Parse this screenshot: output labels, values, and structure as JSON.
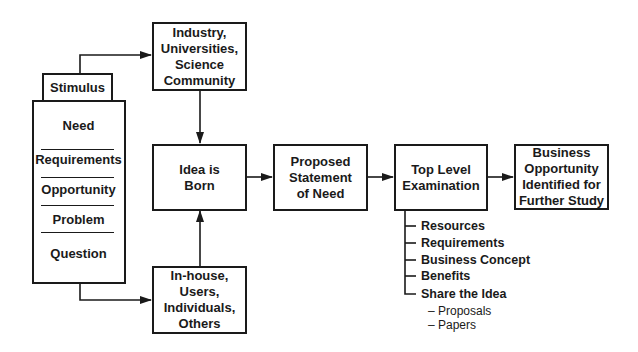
{
  "diagram": {
    "stimulus": {
      "header": "Stimulus",
      "items": [
        "Need",
        "Requirements",
        "Opportunity",
        "Problem",
        "Question"
      ]
    },
    "sources": {
      "external": "Industry,\nUniversities,\nScience\nCommunity",
      "internal": "In-house,\nUsers,\nIndividuals,\nOthers"
    },
    "flow": {
      "idea": "Idea is\nBorn",
      "proposed": "Proposed\nStatement\nof Need",
      "top_level": "Top Level\nExamination",
      "business": "Business\nOpportunity\nIdentified for\nFurther Study"
    },
    "examination_items": [
      "Resources",
      "Requirements",
      "Business Concept",
      "Benefits",
      "Share the Idea"
    ],
    "share_sub_items": [
      "– Proposals",
      "– Papers"
    ],
    "colors": {
      "line": "#1a1a1a",
      "background": "#ffffff"
    }
  }
}
